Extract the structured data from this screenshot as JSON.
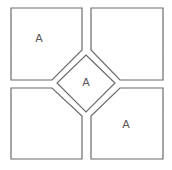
{
  "diagram": {
    "stroke_color": "#6b6b6b",
    "regions": [
      {
        "id": "top-left",
        "label": "A"
      },
      {
        "id": "top-right",
        "label": ""
      },
      {
        "id": "center-diamond",
        "label": "A"
      },
      {
        "id": "bottom-left",
        "label": ""
      },
      {
        "id": "bottom-right",
        "label": "A"
      }
    ]
  }
}
